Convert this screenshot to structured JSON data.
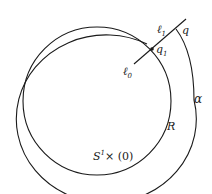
{
  "diagram": {
    "labels": {
      "l1": "ℓ",
      "l1_sub": "1",
      "q": "q",
      "q1": "q",
      "q1_sub": "1",
      "l0": "ℓ",
      "l0_sub": "0",
      "alpha": "α",
      "R": "R",
      "s1": "S",
      "s1_sup": "1",
      "s1_rest": "× (0)"
    },
    "colors": {
      "stroke": "#1a1a1a",
      "background": "#ffffff"
    }
  }
}
